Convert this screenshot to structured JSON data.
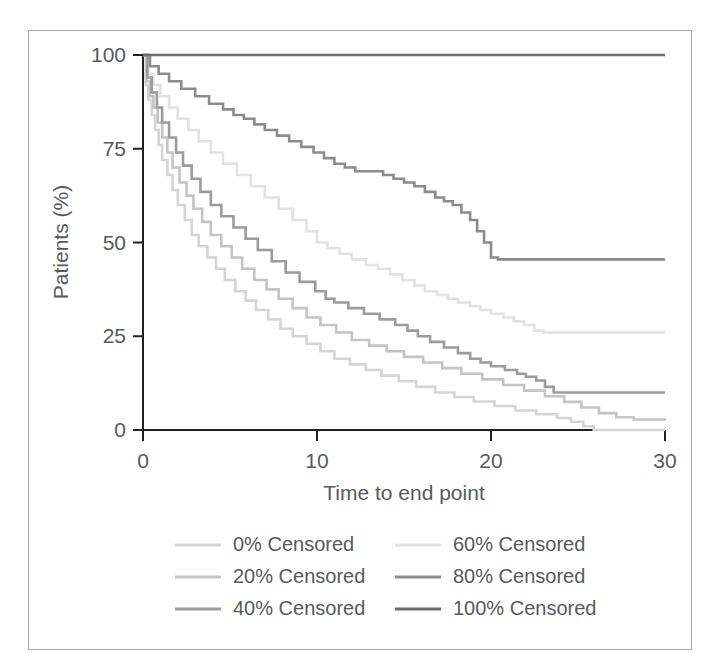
{
  "chart_data": {
    "type": "line",
    "title": "",
    "xlabel": "Time to end point",
    "ylabel": "Patients (%)",
    "xlim": [
      0,
      30
    ],
    "ylim": [
      0,
      100
    ],
    "xticks": [
      0,
      10,
      20,
      30
    ],
    "yticks": [
      0,
      25,
      50,
      75,
      100
    ],
    "xtick_labels": [
      "0",
      "10",
      "20",
      "30"
    ],
    "ytick_labels": [
      "0",
      "25",
      "50",
      "75",
      "100"
    ],
    "grid": false,
    "legend_position": "below-axes",
    "step_style": "post",
    "series": [
      {
        "name": "0% Censored",
        "color": "#d5d5d5",
        "end_value": 0.0,
        "points": [
          [
            0,
            100
          ],
          [
            0.15,
            92
          ],
          [
            0.3,
            88
          ],
          [
            0.5,
            84
          ],
          [
            0.7,
            80
          ],
          [
            0.9,
            76
          ],
          [
            1.1,
            72
          ],
          [
            1.4,
            68
          ],
          [
            1.7,
            64
          ],
          [
            2.0,
            60
          ],
          [
            2.4,
            56
          ],
          [
            2.8,
            52
          ],
          [
            3.2,
            49
          ],
          [
            3.7,
            46
          ],
          [
            4.2,
            43
          ],
          [
            4.7,
            40
          ],
          [
            5.3,
            37
          ],
          [
            5.9,
            34.5
          ],
          [
            6.5,
            32
          ],
          [
            7.2,
            29.5
          ],
          [
            7.9,
            27
          ],
          [
            8.6,
            25
          ],
          [
            9.4,
            23
          ],
          [
            10.2,
            21
          ],
          [
            11.0,
            19
          ],
          [
            11.9,
            17.5
          ],
          [
            12.8,
            16
          ],
          [
            13.7,
            14.5
          ],
          [
            14.7,
            13
          ],
          [
            15.7,
            11.5
          ],
          [
            16.8,
            10
          ],
          [
            17.9,
            8.8
          ],
          [
            19.0,
            7.6
          ],
          [
            20.2,
            6.4
          ],
          [
            21.4,
            5.2
          ],
          [
            22.6,
            4.2
          ],
          [
            23.8,
            3.2
          ],
          [
            24.6,
            2.2
          ],
          [
            25.3,
            1.0
          ],
          [
            25.9,
            0.0
          ],
          [
            30,
            0.0
          ]
        ]
      },
      {
        "name": "20% Censored",
        "color": "#c4c4c4",
        "end_value": 2.5,
        "points": [
          [
            0,
            100
          ],
          [
            0.2,
            93
          ],
          [
            0.4,
            89
          ],
          [
            0.6,
            86
          ],
          [
            0.85,
            82
          ],
          [
            1.1,
            78
          ],
          [
            1.4,
            74
          ],
          [
            1.7,
            70
          ],
          [
            2.1,
            66
          ],
          [
            2.5,
            62.5
          ],
          [
            2.9,
            59
          ],
          [
            3.4,
            55.5
          ],
          [
            3.9,
            52
          ],
          [
            4.5,
            49
          ],
          [
            5.1,
            46
          ],
          [
            5.7,
            43
          ],
          [
            6.4,
            40
          ],
          [
            7.1,
            37.5
          ],
          [
            7.8,
            35
          ],
          [
            8.6,
            32.5
          ],
          [
            9.4,
            30
          ],
          [
            10.2,
            28
          ],
          [
            11.1,
            26
          ],
          [
            12.0,
            24
          ],
          [
            13.0,
            22.5
          ],
          [
            14.0,
            21
          ],
          [
            15.0,
            19.5
          ],
          [
            16.1,
            18
          ],
          [
            17.2,
            16.5
          ],
          [
            18.3,
            15
          ],
          [
            19.5,
            13.5
          ],
          [
            20.7,
            12
          ],
          [
            21.9,
            10.5
          ],
          [
            23.1,
            9
          ],
          [
            24.2,
            7.5
          ],
          [
            25.2,
            6.0
          ],
          [
            26.2,
            4.5
          ],
          [
            27.2,
            3.4
          ],
          [
            28.2,
            2.8
          ],
          [
            30,
            2.5
          ]
        ]
      },
      {
        "name": "40% Censored",
        "color": "#9b9b9b",
        "end_value": 10.0,
        "points": [
          [
            0,
            100
          ],
          [
            0.25,
            94
          ],
          [
            0.5,
            90
          ],
          [
            0.8,
            86
          ],
          [
            1.1,
            82
          ],
          [
            1.5,
            78
          ],
          [
            1.9,
            74
          ],
          [
            2.3,
            70.5
          ],
          [
            2.8,
            67
          ],
          [
            3.3,
            63.5
          ],
          [
            3.9,
            60
          ],
          [
            4.5,
            57
          ],
          [
            5.2,
            54
          ],
          [
            5.9,
            51
          ],
          [
            6.6,
            48
          ],
          [
            7.4,
            45
          ],
          [
            8.2,
            42
          ],
          [
            9.0,
            39.5
          ],
          [
            9.9,
            37
          ],
          [
            10.5,
            35
          ],
          [
            11.0,
            34
          ],
          [
            11.8,
            32.5
          ],
          [
            12.7,
            31
          ],
          [
            13.6,
            29.5
          ],
          [
            14.5,
            28
          ],
          [
            15.2,
            26.5
          ],
          [
            15.8,
            25
          ],
          [
            16.5,
            23.5
          ],
          [
            17.3,
            22
          ],
          [
            18.1,
            20.5
          ],
          [
            18.8,
            19
          ],
          [
            19.4,
            18
          ],
          [
            20.0,
            17
          ],
          [
            20.8,
            16
          ],
          [
            21.5,
            15
          ],
          [
            22.0,
            14.2
          ],
          [
            22.6,
            13.2
          ],
          [
            23.1,
            11.5
          ],
          [
            23.6,
            10.0
          ],
          [
            30,
            10.0
          ]
        ]
      },
      {
        "name": "60% Censored",
        "color": "#e2e2e2",
        "end_value": 26.0,
        "points": [
          [
            0,
            100
          ],
          [
            0.3,
            95
          ],
          [
            0.6,
            92
          ],
          [
            1.0,
            89
          ],
          [
            1.5,
            86
          ],
          [
            2.0,
            83
          ],
          [
            2.6,
            80
          ],
          [
            3.2,
            77
          ],
          [
            3.9,
            74
          ],
          [
            4.6,
            71
          ],
          [
            5.4,
            68
          ],
          [
            6.2,
            65
          ],
          [
            7.0,
            62
          ],
          [
            7.8,
            59
          ],
          [
            8.6,
            56
          ],
          [
            9.4,
            53
          ],
          [
            10.0,
            50
          ],
          [
            10.6,
            48.5
          ],
          [
            11.3,
            47
          ],
          [
            12.0,
            45.5
          ],
          [
            12.8,
            44
          ],
          [
            13.5,
            43
          ],
          [
            14.2,
            41.5
          ],
          [
            14.9,
            40
          ],
          [
            15.6,
            38.5
          ],
          [
            16.2,
            37
          ],
          [
            16.9,
            36
          ],
          [
            17.5,
            35
          ],
          [
            18.1,
            34
          ],
          [
            18.8,
            33
          ],
          [
            19.4,
            32
          ],
          [
            20.0,
            31
          ],
          [
            20.7,
            30
          ],
          [
            21.3,
            29
          ],
          [
            21.9,
            28
          ],
          [
            22.5,
            26.5
          ],
          [
            23.0,
            26.0
          ],
          [
            30,
            26.0
          ]
        ]
      },
      {
        "name": "80% Censored",
        "color": "#8c8c8c",
        "end_value": 45.5,
        "points": [
          [
            0,
            100
          ],
          [
            0.4,
            97
          ],
          [
            0.9,
            95
          ],
          [
            1.5,
            93
          ],
          [
            2.2,
            91
          ],
          [
            3.0,
            89
          ],
          [
            3.8,
            87
          ],
          [
            4.6,
            85.5
          ],
          [
            5.2,
            84
          ],
          [
            5.8,
            83
          ],
          [
            6.4,
            81.5
          ],
          [
            7.0,
            80
          ],
          [
            7.7,
            78.5
          ],
          [
            8.4,
            77
          ],
          [
            9.1,
            75.5
          ],
          [
            9.8,
            74
          ],
          [
            10.4,
            72.5
          ],
          [
            11.0,
            71
          ],
          [
            11.6,
            70
          ],
          [
            12.2,
            69
          ],
          [
            13.0,
            69
          ],
          [
            13.8,
            68
          ],
          [
            14.4,
            67
          ],
          [
            15.0,
            66
          ],
          [
            15.6,
            65
          ],
          [
            16.2,
            63.5
          ],
          [
            16.8,
            62
          ],
          [
            17.3,
            61
          ],
          [
            17.8,
            60
          ],
          [
            18.3,
            58
          ],
          [
            18.8,
            56
          ],
          [
            19.2,
            53
          ],
          [
            19.6,
            50
          ],
          [
            20.0,
            46
          ],
          [
            20.4,
            45.5
          ],
          [
            30,
            45.5
          ]
        ]
      },
      {
        "name": "100% Censored",
        "color": "#6e6e6e",
        "end_value": 100.0,
        "points": [
          [
            0,
            100
          ],
          [
            30,
            100
          ]
        ]
      }
    ]
  },
  "legend": {
    "entries": [
      {
        "label": "0% Censored",
        "color": "#d5d5d5",
        "col": 0,
        "row": 0
      },
      {
        "label": "20% Censored",
        "color": "#c4c4c4",
        "col": 0,
        "row": 1
      },
      {
        "label": "40% Censored",
        "color": "#9b9b9b",
        "col": 0,
        "row": 2
      },
      {
        "label": "60% Censored",
        "color": "#e2e2e2",
        "col": 1,
        "row": 0
      },
      {
        "label": "80% Censored",
        "color": "#8c8c8c",
        "col": 1,
        "row": 1
      },
      {
        "label": "100% Censored",
        "color": "#6e6e6e",
        "col": 1,
        "row": 2
      }
    ]
  },
  "style": {
    "axis_color": "#231f20",
    "frame_color": "#a8a8a8",
    "text_color": "#58595b",
    "background": "#ffffff"
  }
}
